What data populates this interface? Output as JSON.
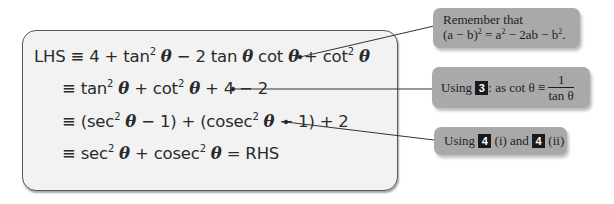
{
  "proof": {
    "lines": [
      {
        "prefix": "LHS ≡ 4 + tan",
        "exp1": "2",
        "theta1": "θ",
        "mid1": " − 2 tan ",
        "theta2": "θ",
        "mid2": " cot ",
        "theta3": "θ",
        "mid3": " + cot",
        "exp2": "2",
        "theta4": "θ"
      },
      {
        "prefix": "≡ tan",
        "exp1": "2",
        "theta1": "θ",
        "mid1": " + cot",
        "exp2": "2",
        "theta2": "θ",
        "tail": " + 4 − 2"
      },
      {
        "prefix": "≡ (sec",
        "exp1": "2",
        "theta1": "θ",
        "mid1": " − 1) + (cosec",
        "exp2": "2",
        "theta2": "θ",
        "tail": " − 1) + 2"
      },
      {
        "prefix": "≡ sec",
        "exp1": "2",
        "theta1": "θ",
        "mid1": " + cosec",
        "exp2": "2",
        "theta2": "θ",
        "tail": " = RHS"
      }
    ]
  },
  "callouts": [
    {
      "line1": "Remember that",
      "line2_a": "(a − b)",
      "line2_sup1": "2",
      "line2_b": " = a",
      "line2_sup2": "2",
      "line2_c": " − 2ab − b",
      "line2_sup3": "2",
      "line2_d": "."
    },
    {
      "text_a": "Using ",
      "badge": "3",
      "text_b": ": as cot θ ≡ ",
      "frac_num": "1",
      "frac_den": "tan θ"
    },
    {
      "text_a": "Using ",
      "badge1": "4",
      "text_b": " (i) and ",
      "badge2": "4",
      "text_c": " (ii)"
    }
  ],
  "colors": {
    "box_bg": "#f2f2f2",
    "callout_bg": "#a9a9a9",
    "badge_bg": "#1a1a1a",
    "line_color": "#333333"
  }
}
